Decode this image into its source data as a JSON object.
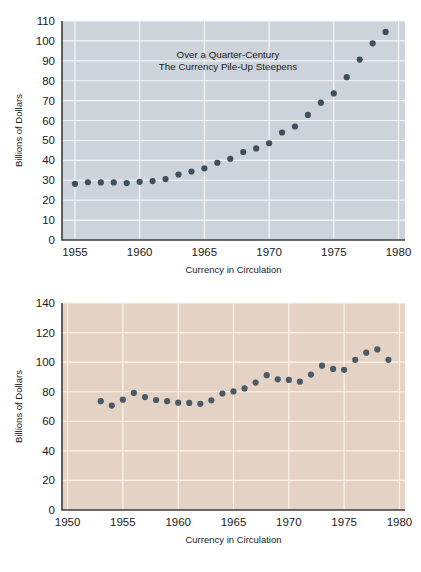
{
  "document": {
    "kind": "two-panel-scatter-figure",
    "background_color": "#ffffff"
  },
  "chart_data": [
    {
      "id": "top",
      "type": "scatter",
      "title": "Over a Quarter-Century\nThe Currency Pile-Up Steepens",
      "title_line1": "Over a Quarter-Century",
      "title_line2": "The Currency Pile-Up Steepens",
      "xlabel": "Currency in Circulation",
      "ylabel": "Billions of Dollars",
      "xlim": [
        1954,
        1980.5
      ],
      "ylim": [
        0,
        110
      ],
      "xticks": [
        1955,
        1960,
        1965,
        1970,
        1975,
        1980
      ],
      "xtick_labels": [
        "1955",
        "1960",
        "1965",
        "1970",
        "1975",
        "1980"
      ],
      "yticks": [
        0,
        10,
        20,
        30,
        40,
        50,
        60,
        70,
        80,
        90,
        100,
        110
      ],
      "ytick_labels": [
        "0",
        "10",
        "20",
        "30",
        "40",
        "50",
        "60",
        "70",
        "80",
        "90",
        "100",
        "110"
      ],
      "grid": true,
      "grid_color": "#f4f6f8",
      "plot_background": "#ccd3da",
      "marker_color": "#3e4f5e",
      "marker_size": 3.1,
      "legend": null,
      "x": [
        1955,
        1956,
        1957,
        1958,
        1959,
        1960,
        1961,
        1962,
        1963,
        1964,
        1965,
        1966,
        1967,
        1968,
        1969,
        1970,
        1971,
        1972,
        1973,
        1974,
        1975,
        1976,
        1977,
        1978,
        1979
      ],
      "values": [
        28.2,
        29.0,
        28.9,
        28.9,
        28.6,
        29.2,
        29.6,
        30.6,
        32.9,
        34.4,
        36.0,
        38.8,
        40.8,
        44.2,
        46.0,
        48.6,
        54.0,
        57.0,
        62.8,
        69.0,
        73.6,
        81.8,
        90.6,
        98.8,
        104.5
      ]
    },
    {
      "id": "bottom",
      "type": "scatter",
      "title": "",
      "xlabel": "Currency in Circulation",
      "ylabel": "Billions of Dollars",
      "xlim": [
        1949.5,
        1980.5
      ],
      "ylim": [
        0,
        140
      ],
      "xticks": [
        1950,
        1955,
        1960,
        1965,
        1970,
        1975,
        1980
      ],
      "xtick_labels": [
        "1950",
        "1955",
        "1960",
        "1965",
        "1970",
        "1975",
        "1980"
      ],
      "yticks": [
        0,
        20,
        40,
        60,
        80,
        100,
        120,
        140
      ],
      "ytick_labels": [
        "0",
        "20",
        "40",
        "60",
        "80",
        "100",
        "120",
        "140"
      ],
      "grid": true,
      "grid_color": "#fbf3ea",
      "plot_background": "#e4d3c4",
      "marker_color": "#4a5a68",
      "marker_size": 3.1,
      "legend": null,
      "x": [
        1953,
        1954,
        1955,
        1956,
        1957,
        1958,
        1959,
        1960,
        1961,
        1962,
        1963,
        1964,
        1965,
        1966,
        1967,
        1968,
        1969,
        1970,
        1971,
        1972,
        1973,
        1974,
        1975,
        1976,
        1977,
        1978,
        1979
      ],
      "values": [
        73.6,
        70.6,
        74.6,
        79.2,
        76.4,
        74.4,
        73.6,
        72.6,
        72.4,
        71.8,
        74.2,
        78.8,
        80.2,
        82.2,
        86.2,
        91.2,
        88.4,
        88.0,
        86.8,
        91.6,
        97.6,
        95.4,
        94.8,
        101.6,
        106.4,
        108.6,
        101.6
      ]
    }
  ]
}
